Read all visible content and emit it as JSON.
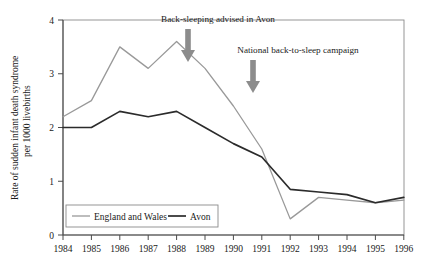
{
  "chart_data": {
    "type": "line",
    "title": "",
    "xlabel": "",
    "ylabel": "Rate of sudden infant death syndrome per 1000 livebirths",
    "ylabel_line1": "Rate of sudden infant death syndrome",
    "ylabel_line2": "per 1000 livebirths",
    "x": [
      1984,
      1985,
      1986,
      1987,
      1988,
      1989,
      1990,
      1991,
      1992,
      1993,
      1994,
      1995,
      1996
    ],
    "xtick_labels": [
      "1984",
      "1985",
      "1986",
      "1987",
      "1988",
      "1989",
      "1990",
      "1991",
      "1992",
      "1993",
      "1994",
      "1995",
      "1996"
    ],
    "ytick_labels": [
      "0",
      "1",
      "2",
      "3",
      "4"
    ],
    "yticks": [
      0,
      1,
      2,
      3,
      4
    ],
    "ylim": [
      0,
      4
    ],
    "xlim": [
      1984,
      1996
    ],
    "grid": false,
    "legend_position": "lower left",
    "series": [
      {
        "name": "England and Wales",
        "color": "#999999",
        "values": [
          2.2,
          2.5,
          3.5,
          3.1,
          3.6,
          3.1,
          2.4,
          1.6,
          0.3,
          0.7,
          0.65,
          0.6,
          0.65
        ]
      },
      {
        "name": "Avon",
        "color": "#2b2b2b",
        "values": [
          2.0,
          2.0,
          2.3,
          2.2,
          2.3,
          2.0,
          1.7,
          1.45,
          0.85,
          0.8,
          0.75,
          0.6,
          0.7
        ]
      }
    ],
    "annotations": [
      {
        "text": "Back-sleeping advised in Avon",
        "arrow_year": 1989,
        "arrow_color": "#808080",
        "text_x": 218,
        "text_y": 22,
        "arrow_x": 188,
        "arrow_top": 30,
        "arrow_bottom": 62
      },
      {
        "text": "National back-to-sleep campaign",
        "arrow_year": 1991,
        "arrow_color": "#808080",
        "text_x": 298,
        "text_y": 52,
        "arrow_x": 253,
        "arrow_top": 60,
        "arrow_bottom": 92
      }
    ]
  },
  "legend": {
    "items": [
      {
        "label": "England and Wales",
        "color": "#999999"
      },
      {
        "label": "Avon",
        "color": "#2b2b2b"
      }
    ]
  }
}
